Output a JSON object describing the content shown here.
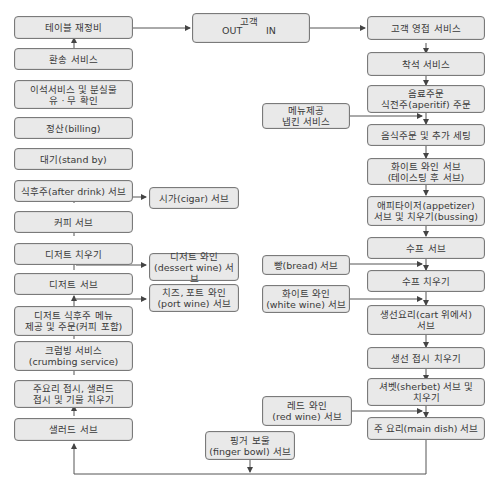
{
  "diagram": {
    "type": "restaurant-service-flowchart",
    "center": {
      "title": "고객",
      "out_label": "OUT",
      "in_label": "IN"
    },
    "right_column": [
      {
        "id": "r1",
        "label": "고객 영접 서비스"
      },
      {
        "id": "r2",
        "label": "착석 서비스"
      },
      {
        "id": "r3",
        "label": "음료주문\n식전주(aperitif) 주문"
      },
      {
        "id": "r4",
        "label": "음식주문 및 추가 세팅"
      },
      {
        "id": "r5",
        "label": "화이트 와인 서브\n(테이스팅 후 서브)"
      },
      {
        "id": "r6",
        "label": "애피타이저(appetizer)\n서브 및 치우기(bussing)"
      },
      {
        "id": "r7",
        "label": "수프 서브"
      },
      {
        "id": "r8",
        "label": "수프 치우기"
      },
      {
        "id": "r9",
        "label": "생선요리(cart 위에서)\n서브"
      },
      {
        "id": "r10",
        "label": "생선 접시 치우기"
      },
      {
        "id": "r11",
        "label": "셔벳(sherbet) 서브 및\n치우기"
      },
      {
        "id": "r12",
        "label": "주 요리(main dish) 서브"
      }
    ],
    "right_side_inputs": [
      {
        "id": "ri1",
        "label": "메뉴제공\n냅킨 서비스",
        "joins": "r4"
      },
      {
        "id": "ri2",
        "label": "빵(bread) 서브",
        "joins": "r8"
      },
      {
        "id": "ri3",
        "label": "화이트 와인\n(white wine) 서브",
        "joins": "r9"
      },
      {
        "id": "ri4",
        "label": "레드 와인\n(red wine) 서브",
        "joins": "r12"
      }
    ],
    "bottom_input": {
      "id": "b1",
      "label": "핑거 보울\n(finger bowl) 서브"
    },
    "left_column": [
      {
        "id": "l1",
        "label": "테이블 재정비"
      },
      {
        "id": "l2",
        "label": "환송 서비스"
      },
      {
        "id": "l3",
        "label": "이석서비스 및 분실물\n유 · 무 확인"
      },
      {
        "id": "l4",
        "label": "정산(billing)"
      },
      {
        "id": "l5",
        "label": "대기(stand by)"
      },
      {
        "id": "l6",
        "label": "식후주(after drink) 서브"
      },
      {
        "id": "l7",
        "label": "커피 서브"
      },
      {
        "id": "l8",
        "label": "디저트 치우기"
      },
      {
        "id": "l9",
        "label": "디저트 서브"
      },
      {
        "id": "l10",
        "label": "디저트 식후주 메뉴\n제공 및 주문(커피 포함)"
      },
      {
        "id": "l11",
        "label": "크럼빙 서비스\n(crumbing service)"
      },
      {
        "id": "l12",
        "label": "주요리 접시, 샐러드\n접시 및 기물 치우기"
      },
      {
        "id": "l13",
        "label": "샐러드 서브"
      }
    ],
    "left_side_outputs": [
      {
        "id": "lo1",
        "label": "시가(cigar) 서브"
      },
      {
        "id": "lo2",
        "label": "디저트 와인\n(dessert wine) 서브"
      },
      {
        "id": "lo3",
        "label": "치즈, 포트 와인\n(port wine) 서브"
      }
    ],
    "colors": {
      "box_fill": "#e9e9e9",
      "box_border": "#7a7a7a",
      "line": "#555555"
    }
  }
}
